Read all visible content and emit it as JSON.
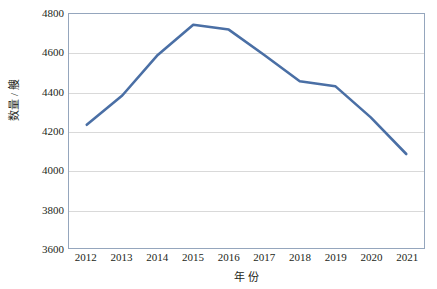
{
  "chart_data": {
    "type": "line",
    "title": "",
    "xlabel": "年 份",
    "ylabel": "数量 / 艘",
    "categories": [
      "2012",
      "2013",
      "2014",
      "2015",
      "2016",
      "2017",
      "2018",
      "2019",
      "2020",
      "2021"
    ],
    "values": [
      4232,
      4382,
      4590,
      4745,
      4720,
      4590,
      4455,
      4430,
      4270,
      4082
    ],
    "series": [
      {
        "name": "数量",
        "values": [
          4232,
          4382,
          4590,
          4745,
          4720,
          4590,
          4455,
          4430,
          4270,
          4082
        ]
      }
    ],
    "ylim": [
      3600,
      4800
    ],
    "y_ticks": [
      3600,
      3800,
      4000,
      4200,
      4400,
      4600,
      4800
    ],
    "y_tick_labels": [
      "3600",
      "3800",
      "4000",
      "4200",
      "4400",
      "4600",
      "4800"
    ],
    "x_tick_labels": [
      "2012",
      "2013",
      "2014",
      "2015",
      "2016",
      "2017",
      "2018",
      "2019",
      "2020",
      "2021"
    ],
    "grid": true,
    "grid_axis": "y",
    "legend": false,
    "legend_position": "none",
    "line_color": "#4A6FA5",
    "grid_color": "#D9D9D9",
    "frame_color": "#95A6BD",
    "background_color": "#FFFFFF",
    "line_width": 2.6,
    "markers": false
  }
}
